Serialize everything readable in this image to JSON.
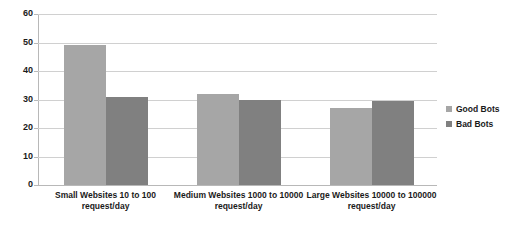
{
  "chart_data": {
    "type": "bar",
    "title": "",
    "xlabel": "",
    "ylabel": "",
    "ylim": [
      0,
      60
    ],
    "yticks": [
      0,
      10,
      20,
      30,
      40,
      50,
      60
    ],
    "grid": true,
    "legend_position": "right",
    "categories": [
      "Small Websites 10 to 100 request/day",
      "Medium Websites 1000 to 10000 request/day",
      "Large Websites 10000 to 100000 request/day"
    ],
    "series": [
      {
        "name": "Good Bots",
        "color": "#a6a6a6",
        "values": [
          49,
          32,
          27
        ]
      },
      {
        "name": "Bad Bots",
        "color": "#808080",
        "values": [
          31,
          30,
          29.5
        ]
      }
    ]
  },
  "axis": {
    "y_tick_labels": [
      "60",
      "50",
      "40",
      "30",
      "20",
      "10",
      "0"
    ]
  },
  "legend": {
    "items": [
      {
        "label": "Good Bots"
      },
      {
        "label": "Bad Bots"
      }
    ]
  },
  "title_strip": {
    "text": ""
  }
}
